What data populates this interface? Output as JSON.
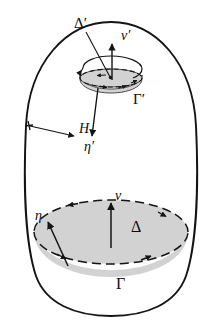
{
  "figure": {
    "background_color": "#ffffff",
    "stroke_color": "#141414",
    "shade_color": "#d2d2d2",
    "labels": {
      "outer_domain": "H",
      "big_disk": "Δ",
      "big_disk_boundary": "Γ",
      "big_disk_normal": "ν",
      "big_disk_conormal": "η",
      "small_disk": "Δ′",
      "small_disk_boundary": "Γ′",
      "small_disk_normal": "ν′",
      "small_disk_conormal": "η′"
    },
    "elements": [
      {
        "name": "outer-boundary",
        "kind": "closed-oval-curve",
        "style": "solid"
      },
      {
        "name": "big-disk-surface",
        "kind": "ellipse",
        "style": "shaded"
      },
      {
        "name": "big-disk-rim",
        "kind": "ellipse-outline",
        "style": "dashed-with-arrows"
      },
      {
        "name": "big-disk-front-rim",
        "kind": "arc",
        "style": "dashed-with-arrows"
      },
      {
        "name": "small-disk-surface",
        "kind": "ellipse",
        "style": "shaded"
      },
      {
        "name": "small-disk-rim",
        "kind": "ellipse-outline",
        "style": "dashed-with-arrows"
      },
      {
        "name": "small-disk-rotation",
        "kind": "circular-arrow",
        "style": "solid"
      },
      {
        "name": "normal-vector-big",
        "kind": "arrow",
        "style": "solid"
      },
      {
        "name": "conormal-vector-big",
        "kind": "arrow",
        "style": "solid"
      },
      {
        "name": "normal-vector-small",
        "kind": "arrow",
        "style": "solid"
      },
      {
        "name": "conormal-vector-small",
        "kind": "arrow",
        "style": "solid"
      },
      {
        "name": "leader-line-delta-prime",
        "kind": "leader-line",
        "style": "solid"
      },
      {
        "name": "pointer-arrow-h",
        "kind": "arrow",
        "style": "solid"
      }
    ]
  }
}
